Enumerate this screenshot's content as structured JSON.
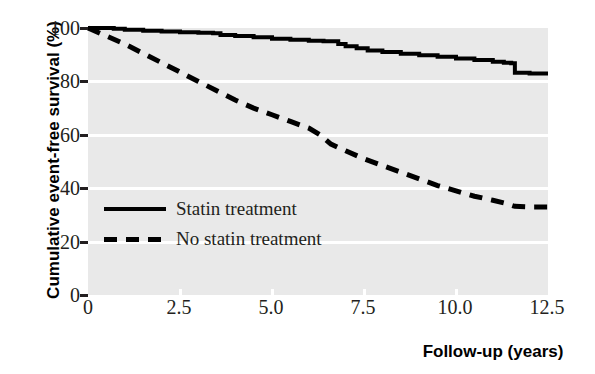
{
  "chart_data": {
    "type": "line",
    "title": "",
    "xlabel": "Follow-up (years)",
    "ylabel": "Cumulative event-free survival (%)",
    "xlim": [
      0,
      12.5
    ],
    "ylim": [
      0,
      100
    ],
    "xticks": [
      "0",
      "2.5",
      "5.0",
      "7.5",
      "10.0",
      "12.5"
    ],
    "xtick_values": [
      0,
      2.5,
      5.0,
      7.5,
      10.0,
      12.5
    ],
    "yticks": [
      "0",
      "20",
      "40",
      "60",
      "80",
      "100"
    ],
    "ytick_values": [
      0,
      20,
      40,
      60,
      80,
      100
    ],
    "grid": "horizontal-white",
    "plot_background": "#e9e9e9",
    "legend_position": "inside-left-lower",
    "series": [
      {
        "name": "Statin treatment",
        "style": "solid",
        "color": "#000000",
        "x": [
          0,
          0.3,
          0.7,
          1.0,
          1.5,
          2.0,
          2.5,
          3.0,
          3.4,
          3.6,
          4.0,
          4.5,
          5.0,
          5.5,
          6.0,
          6.4,
          6.8,
          7.0,
          7.3,
          7.6,
          8.0,
          8.5,
          9.0,
          9.5,
          10.0,
          10.5,
          11.0,
          11.3,
          11.5,
          11.6,
          12.0,
          12.5
        ],
        "y": [
          100,
          100,
          99.7,
          99.3,
          99.0,
          98.7,
          98.4,
          98.2,
          98.0,
          97.4,
          97.0,
          96.5,
          96.0,
          95.6,
          95.2,
          95.0,
          94.0,
          93.2,
          92.4,
          91.6,
          91.0,
          90.4,
          89.8,
          89.2,
          88.6,
          88.0,
          87.4,
          87.0,
          86.8,
          83.2,
          83.0,
          83.0
        ]
      },
      {
        "name": "No statin treatment",
        "style": "dashed",
        "color": "#000000",
        "x": [
          0,
          0.5,
          1.0,
          1.5,
          2.0,
          2.5,
          3.0,
          3.5,
          4.0,
          4.5,
          5.0,
          5.5,
          6.0,
          6.3,
          6.6,
          7.0,
          7.5,
          8.0,
          8.5,
          9.0,
          9.5,
          10.0,
          10.5,
          11.0,
          11.3,
          11.6,
          12.0,
          12.5
        ],
        "y": [
          100,
          97.0,
          94.0,
          90.5,
          87.0,
          83.5,
          80.0,
          76.5,
          73.0,
          70.0,
          67.5,
          65.0,
          62.5,
          60.0,
          56.5,
          54.0,
          51.0,
          48.5,
          46.0,
          43.5,
          41.0,
          39.0,
          37.0,
          35.5,
          34.5,
          33.2,
          33.0,
          33.0
        ]
      }
    ]
  },
  "legend": {
    "items": [
      {
        "label": "Statin treatment",
        "style": "solid"
      },
      {
        "label": "No statin treatment",
        "style": "dashed"
      }
    ]
  },
  "axes": {
    "x_title": "Follow-up (years)",
    "y_title": "Cumulative event-free survival (%)"
  }
}
